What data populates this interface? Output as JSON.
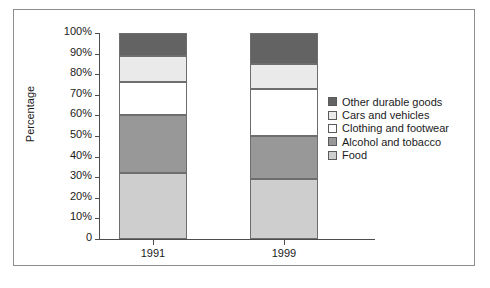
{
  "chart_data": {
    "type": "bar",
    "stacked": true,
    "normalized_percent": true,
    "title": "",
    "xlabel": "",
    "ylabel": "Percentage",
    "categories": [
      "1991",
      "1999"
    ],
    "ylim": [
      0,
      100
    ],
    "ytick_labels": [
      "100%",
      "90%",
      "80%",
      "70%",
      "60%",
      "50%",
      "40%",
      "30%",
      "20%",
      "10%",
      "0"
    ],
    "ytick_values": [
      100,
      90,
      80,
      70,
      60,
      50,
      40,
      30,
      20,
      10,
      0
    ],
    "grid": false,
    "legend_position": "right",
    "series": [
      {
        "name": "Food",
        "color": "#cecece",
        "values": [
          32,
          29
        ]
      },
      {
        "name": "Alcohol and tobacco",
        "color": "#989898",
        "values": [
          28,
          21
        ]
      },
      {
        "name": "Clothing and footwear",
        "color": "#ffffff",
        "values": [
          16,
          23
        ]
      },
      {
        "name": "Cars and vehicles",
        "color": "#eaeaea",
        "values": [
          13,
          12
        ]
      },
      {
        "name": "Other durable goods",
        "color": "#636363",
        "values": [
          11,
          15
        ]
      }
    ],
    "legend_order_top_to_bottom": [
      "Other durable goods",
      "Cars and vehicles",
      "Clothing and footwear",
      "Alcohol and tobacco",
      "Food"
    ],
    "cumulative_tops": {
      "1991": {
        "Food": 32,
        "Alcohol and tobacco": 60,
        "Clothing and footwear": 76,
        "Cars and vehicles": 89,
        "Other durable goods": 100
      },
      "1999": {
        "Food": 29,
        "Alcohol and tobacco": 50,
        "Clothing and footwear": 73,
        "Cars and vehicles": 85,
        "Other durable goods": 100
      }
    }
  }
}
